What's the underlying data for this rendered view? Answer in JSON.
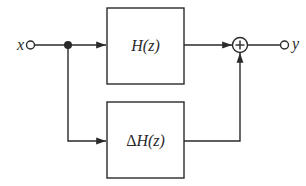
{
  "diagram": {
    "type": "block-diagram",
    "input": {
      "label": "x"
    },
    "output": {
      "label": "y"
    },
    "blocks": [
      {
        "id": "top",
        "label": "H(z)"
      },
      {
        "id": "bottom",
        "label_prefix": "Δ",
        "label": "H(z)"
      }
    ],
    "summing_junction": {
      "symbol": "+"
    },
    "connections": [
      [
        "x",
        "branch-point"
      ],
      [
        "branch-point",
        "top"
      ],
      [
        "branch-point",
        "bottom"
      ],
      [
        "top",
        "sum"
      ],
      [
        "bottom",
        "sum"
      ],
      [
        "sum",
        "y"
      ]
    ],
    "colors": {
      "stroke": "#2a2a2a",
      "background": "#ffffff"
    }
  }
}
